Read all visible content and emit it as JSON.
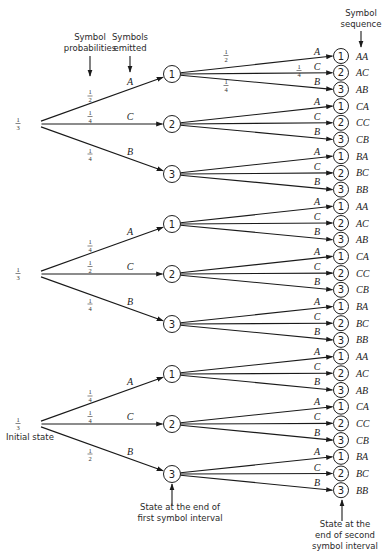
{
  "diagram": {
    "annotations": {
      "symbol_probabilities": [
        "Symbol",
        "probabilities"
      ],
      "symbols_emitted": [
        "Symbols",
        "emitted"
      ],
      "symbol_sequence": [
        "Symbol",
        "sequence"
      ],
      "initial_state": "Initial state",
      "end_first": [
        "State at the end of",
        "first symbol interval"
      ],
      "end_second": [
        "State at the",
        "end of second",
        "symbol interval"
      ]
    },
    "initial_probability": "1/3",
    "roots": [
      {
        "state": "1",
        "prob": "1/3",
        "branches": [
          {
            "symbol": "A",
            "prob": "1/2",
            "to": "1"
          },
          {
            "symbol": "C",
            "prob": "1/4",
            "to": "2"
          },
          {
            "symbol": "B",
            "prob": "1/4",
            "to": "3"
          }
        ]
      },
      {
        "state": "2",
        "prob": "1/3",
        "branches": [
          {
            "symbol": "A",
            "prob": "1/4",
            "to": "1"
          },
          {
            "symbol": "C",
            "prob": "1/2",
            "to": "2"
          },
          {
            "symbol": "B",
            "prob": "1/4",
            "to": "3"
          }
        ]
      },
      {
        "state": "3",
        "prob": "1/3",
        "branches": [
          {
            "symbol": "A",
            "prob": "1/4",
            "to": "1"
          },
          {
            "symbol": "C",
            "prob": "1/4",
            "to": "2"
          },
          {
            "symbol": "B",
            "prob": "1/2",
            "to": "3"
          }
        ]
      }
    ],
    "second_level_example_probs": {
      "A": "1/2",
      "C": "1/4",
      "B": "1/4"
    },
    "leaf_symbols": [
      "A",
      "C",
      "B"
    ],
    "leaf_states": [
      "1",
      "2",
      "3"
    ],
    "sequences": [
      [
        "AA",
        "AC",
        "AB",
        "CA",
        "CC",
        "CB",
        "BA",
        "BC",
        "BB"
      ],
      [
        "AA",
        "AC",
        "AB",
        "CA",
        "CC",
        "CB",
        "BA",
        "BC",
        "BB"
      ],
      [
        "AA",
        "AC",
        "AB",
        "CA",
        "CC",
        "CB",
        "BA",
        "BC",
        "BB"
      ]
    ]
  }
}
